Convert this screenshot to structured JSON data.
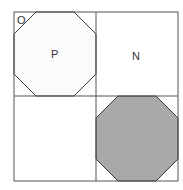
{
  "diagram": {
    "title": "",
    "labels": {
      "O": "O",
      "P": "P",
      "N": "N"
    },
    "colors": {
      "line": "#3a3a3a",
      "grid": "#555555",
      "octagon_fill_light": "#fbfbfb",
      "octagon_fill_shaded": "#a9a9a9",
      "background": "#ffffff"
    },
    "quadrants": [
      {
        "position": "top-left",
        "content": "octagon with label P, corner label O"
      },
      {
        "position": "top-right",
        "content": "empty square with label N"
      },
      {
        "position": "bottom-left",
        "content": "empty square"
      },
      {
        "position": "bottom-right",
        "content": "shaded octagon"
      }
    ]
  }
}
